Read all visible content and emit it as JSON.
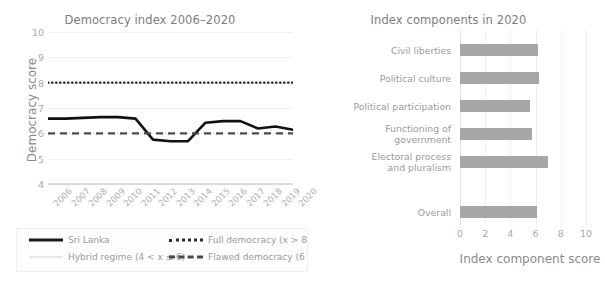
{
  "left_chart": {
    "title": "Democracy index 2006–2020",
    "y_axis_label": "Democracy score",
    "y_ticks": [
      4,
      5,
      6,
      7,
      8,
      9,
      10
    ],
    "x_ticks": [
      "2006",
      "2007",
      "2008",
      "2009",
      "2010",
      "2011",
      "2012",
      "2013",
      "2014",
      "2015",
      "2016",
      "2017",
      "2018",
      "2019",
      "2020"
    ],
    "legend": [
      {
        "label": "Sri Lanka",
        "style": "solid"
      },
      {
        "label": "Hybrid regime (4 < x ≤ 6)",
        "style": "light"
      },
      {
        "label": "Full democracy (x > 8)",
        "style": "dotted"
      },
      {
        "label": "Flawed democracy (6 < x ≤ 8)",
        "style": "dashed"
      }
    ]
  },
  "right_chart": {
    "title": "Index components in 2020",
    "x_axis_label": "Index component score"
  },
  "chart_data": [
    {
      "type": "line",
      "title": "Democracy index 2006–2020",
      "xlabel": "",
      "ylabel": "Democracy score",
      "ylim": [
        4,
        10
      ],
      "grid": true,
      "legend_position": "bottom",
      "x": [
        2006,
        2007,
        2008,
        2009,
        2010,
        2011,
        2012,
        2013,
        2014,
        2015,
        2016,
        2017,
        2018,
        2019,
        2020
      ],
      "series": [
        {
          "name": "Sri Lanka",
          "style": "solid",
          "values": [
            6.58,
            6.58,
            6.61,
            6.64,
            6.64,
            6.58,
            5.75,
            5.69,
            5.69,
            6.42,
            6.48,
            6.48,
            6.19,
            6.27,
            6.14
          ]
        },
        {
          "name": "Full democracy (x > 8)",
          "style": "dotted",
          "constant": 8
        },
        {
          "name": "Flawed democracy (6 < x ≤ 8)",
          "style": "dashed",
          "constant": 6
        },
        {
          "name": "Hybrid regime (4 < x ≤ 6)",
          "style": "light",
          "constant": 4
        }
      ]
    },
    {
      "type": "bar",
      "orientation": "horizontal",
      "title": "Index components in 2020",
      "xlabel": "Index component score",
      "ylabel": "",
      "xlim": [
        0,
        10
      ],
      "x_ticks": [
        0,
        2,
        4,
        6,
        8,
        10
      ],
      "grid": true,
      "bar_color": "#a6a6a6",
      "categories": [
        "Civil liberties",
        "Political culture",
        "Political participation",
        "Functioning of\ngovernment",
        "Electoral process\nand pluralism",
        "Overall"
      ],
      "values": [
        6.18,
        6.25,
        5.56,
        5.71,
        7.0,
        6.14
      ]
    }
  ]
}
